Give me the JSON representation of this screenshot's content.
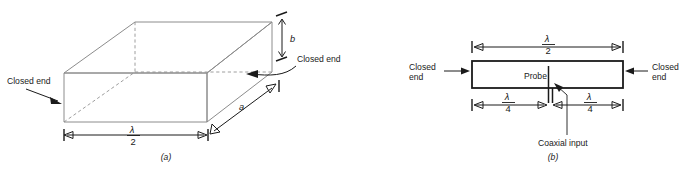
{
  "figure": {
    "colors": {
      "edge_solid": "#8c8c8c",
      "edge_dashed": "#9e9e9e",
      "ink": "#1a1a1a",
      "background": "#ffffff"
    }
  },
  "panel_a": {
    "caption": "(a)",
    "labels": {
      "closed_end_left": "Closed end",
      "closed_end_right": "Closed end",
      "height_b": "b",
      "depth_a": "a"
    },
    "dimension_length": {
      "numerator": "λ",
      "denominator": "2"
    }
  },
  "panel_b": {
    "caption": "(b)",
    "labels": {
      "closed_end_left_line1": "Closed",
      "closed_end_left_line2": "end",
      "closed_end_right_line1": "Closed",
      "closed_end_right_line2": "end",
      "probe": "Probe",
      "coaxial_input": "Coaxial input"
    },
    "dimension_total": {
      "numerator": "λ",
      "denominator": "2"
    },
    "dimension_left_quarter": {
      "numerator": "λ",
      "denominator": "4"
    },
    "dimension_right_quarter": {
      "numerator": "λ",
      "denominator": "4"
    }
  }
}
